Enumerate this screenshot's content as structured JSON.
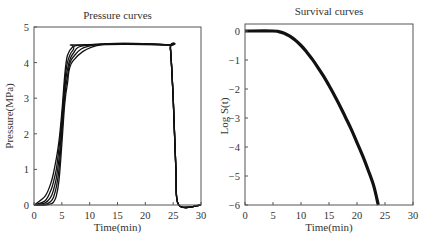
{
  "chart_data": [
    {
      "type": "line",
      "title": "Pressure curves",
      "xlabel": "Time(min)",
      "ylabel": "Pressure(MPa)",
      "xlim": [
        0,
        30
      ],
      "ylim": [
        0,
        5
      ],
      "xticks": [
        "0",
        "5",
        "10",
        "15",
        "20",
        "25",
        "30"
      ],
      "yticks": [
        "0",
        "1",
        "2",
        "3",
        "4",
        "5"
      ],
      "grid": false,
      "legend": null,
      "series": [
        {
          "name": "curve 1",
          "x": [
            0,
            2,
            3,
            3.5,
            4,
            4.5,
            5,
            5.5,
            6,
            7,
            8,
            24,
            24.5,
            25,
            25.5,
            26,
            30
          ],
          "y": [
            0,
            0.25,
            0.6,
            0.9,
            1.3,
            1.8,
            2.6,
            3.6,
            4.2,
            4.45,
            4.5,
            4.5,
            4.4,
            3.0,
            1.0,
            0,
            0
          ]
        },
        {
          "name": "curve 2",
          "x": [
            0,
            2,
            3,
            3.5,
            4,
            4.5,
            5,
            5.5,
            6,
            7,
            9,
            24,
            24.5,
            25,
            25.5,
            26,
            30
          ],
          "y": [
            0,
            0.12,
            0.4,
            0.65,
            1.0,
            1.6,
            2.4,
            3.4,
            4.0,
            4.35,
            4.5,
            4.5,
            4.4,
            3.0,
            1.0,
            0,
            0
          ]
        },
        {
          "name": "curve 3",
          "x": [
            0,
            2,
            3,
            3.5,
            4,
            4.5,
            5,
            5.5,
            6,
            7,
            10,
            24,
            24.5,
            25,
            25.5,
            26,
            30
          ],
          "y": [
            0,
            0.06,
            0.22,
            0.42,
            0.75,
            1.3,
            2.2,
            3.2,
            3.8,
            4.25,
            4.5,
            4.5,
            4.4,
            3.0,
            1.0,
            0,
            0
          ]
        },
        {
          "name": "curve 4",
          "x": [
            0,
            2,
            3,
            3.5,
            4,
            4.5,
            5,
            5.5,
            6,
            7,
            11,
            24,
            24.5,
            25,
            25.5,
            26,
            30
          ],
          "y": [
            0,
            0.02,
            0.1,
            0.22,
            0.5,
            1.0,
            2.0,
            3.0,
            3.6,
            4.15,
            4.5,
            4.5,
            4.4,
            3.0,
            1.0,
            0,
            0
          ]
        },
        {
          "name": "curve 5",
          "x": [
            0,
            2,
            3,
            3.5,
            4,
            4.5,
            5,
            5.5,
            6,
            7,
            12,
            24,
            24.5,
            25,
            25.5,
            26,
            30
          ],
          "y": [
            0,
            0,
            0.03,
            0.08,
            0.25,
            0.7,
            1.7,
            2.8,
            3.4,
            4.05,
            4.5,
            4.5,
            4.4,
            3.0,
            1.0,
            0,
            0
          ]
        }
      ]
    },
    {
      "type": "line",
      "title": "Survival curves",
      "xlabel": "Time(min)",
      "ylabel": "Log S(t)",
      "xlim": [
        0,
        30
      ],
      "ylim": [
        -6,
        0.3
      ],
      "xticks": [
        "0",
        "5",
        "10",
        "15",
        "20",
        "25",
        "30"
      ],
      "yticks": [
        "0",
        "−1",
        "−2",
        "−3",
        "−4",
        "−5",
        "−6"
      ],
      "grid": false,
      "legend": null,
      "series": [
        {
          "name": "survival",
          "x": [
            0,
            5,
            6,
            7,
            8,
            9,
            10,
            11,
            12,
            13,
            14,
            15,
            16,
            17,
            18,
            19,
            20,
            21,
            22,
            23,
            23.8
          ],
          "y": [
            0,
            0,
            -0.02,
            -0.08,
            -0.18,
            -0.32,
            -0.5,
            -0.72,
            -0.97,
            -1.25,
            -1.55,
            -1.88,
            -2.23,
            -2.6,
            -3.0,
            -3.4,
            -3.85,
            -4.3,
            -4.8,
            -5.35,
            -6.0
          ]
        }
      ]
    }
  ]
}
